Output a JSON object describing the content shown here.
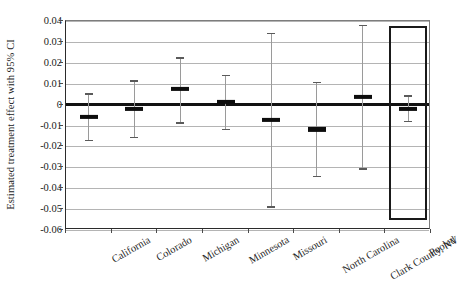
{
  "chart_data": {
    "type": "scatter",
    "title": "",
    "subtitle": "",
    "xlabel": "",
    "ylabel": "Estimated treatment effect with 95% CI",
    "categories": [
      "California",
      "Colorado",
      "Michigan",
      "Minnesota",
      "Missouri",
      "North Carolina",
      "Clark County, NV",
      "Pooled"
    ],
    "ylim": [
      -0.06,
      0.04
    ],
    "yticks": [
      0.04,
      0.03,
      0.02,
      0.01,
      0,
      -0.01,
      -0.02,
      -0.03,
      -0.04,
      -0.05,
      -0.06
    ],
    "ytick_labels": [
      "0.04",
      "0.03",
      "0.02",
      "0.01",
      "0",
      "-0.01",
      "-0.02",
      "-0.03",
      "-0.04",
      "-0.05",
      "-0.06"
    ],
    "grid": true,
    "legend": "none",
    "zero_reference_line": 0,
    "series": [
      {
        "name": "Estimated treatment effect",
        "estimates": [
          -0.006,
          -0.0022,
          0.0075,
          0.0013,
          -0.0074,
          -0.0119,
          0.0035,
          -0.0019
        ],
        "ci_lower": [
          -0.0172,
          -0.0158,
          -0.0088,
          -0.0119,
          -0.049,
          -0.0345,
          -0.0308,
          -0.008
        ],
        "ci_upper": [
          0.0052,
          0.0112,
          0.0224,
          0.0139,
          0.034,
          0.0105,
          0.0378,
          0.004
        ]
      }
    ],
    "annotations": [
      {
        "name": "pooled-highlight-box",
        "type": "rectangle",
        "category": "Pooled",
        "y_top": 0.0378,
        "y_bottom": -0.0552
      }
    ]
  }
}
